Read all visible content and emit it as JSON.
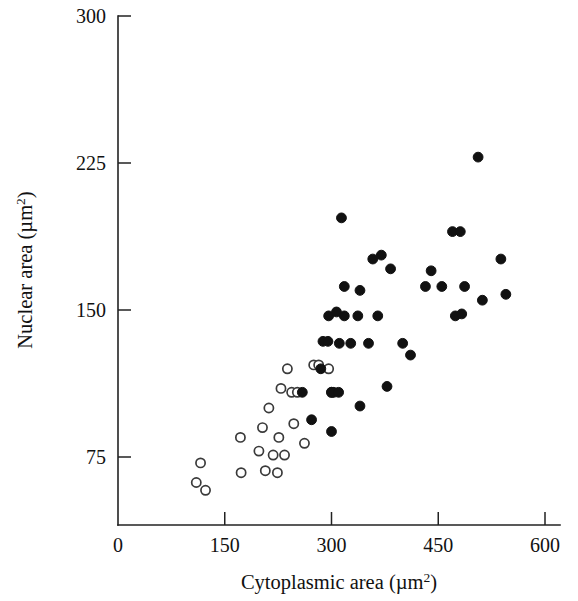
{
  "chart_data": {
    "type": "scatter",
    "title": "",
    "xlabel": "Cytoplasmic area (µm2)",
    "ylabel": "Nuclear area (µm2)",
    "xlabel_base": "Cytoplasmic area (µm",
    "xlabel_sup": "2",
    "xlabel_close": ")",
    "ylabel_base": "Nuclear area (µm",
    "ylabel_sup": "2",
    "ylabel_close": ")",
    "xlim": [
      0,
      600
    ],
    "ylim": [
      55,
      300
    ],
    "xticks": [
      0,
      150,
      300,
      450,
      600
    ],
    "yticks": [
      75,
      150,
      225,
      300
    ],
    "xtick_labels": [
      "0",
      "150",
      "300",
      "450",
      "600"
    ],
    "ytick_labels": [
      "75",
      "150",
      "225",
      "300"
    ],
    "grid": false,
    "legend": "none",
    "marker_colors": {
      "filled": "#111111",
      "open_stroke": "#3a3a3a",
      "open_fill": "#ffffff"
    },
    "series": [
      {
        "name": "open circles",
        "marker": "open-circle",
        "points": [
          [
            110,
            62
          ],
          [
            123,
            58
          ],
          [
            116,
            72
          ],
          [
            172,
            85
          ],
          [
            173,
            67
          ],
          [
            198,
            78
          ],
          [
            203,
            90
          ],
          [
            207,
            68
          ],
          [
            212,
            100
          ],
          [
            218,
            76
          ],
          [
            224,
            67
          ],
          [
            226,
            85
          ],
          [
            229,
            110
          ],
          [
            234,
            76
          ],
          [
            238,
            120
          ],
          [
            244,
            108
          ],
          [
            247,
            92
          ],
          [
            252,
            108
          ],
          [
            262,
            82
          ],
          [
            275,
            122
          ],
          [
            282,
            122
          ],
          [
            296,
            120
          ],
          [
            300,
            108
          ]
        ]
      },
      {
        "name": "filled circles",
        "marker": "filled-circle",
        "points": [
          [
            259,
            108
          ],
          [
            272,
            94
          ],
          [
            285,
            120
          ],
          [
            288,
            134
          ],
          [
            295,
            134
          ],
          [
            296,
            147
          ],
          [
            300,
            108
          ],
          [
            303,
            108
          ],
          [
            307,
            149
          ],
          [
            310,
            108
          ],
          [
            300,
            88
          ],
          [
            311,
            133
          ],
          [
            314,
            197
          ],
          [
            318,
            147
          ],
          [
            318,
            162
          ],
          [
            327,
            133
          ],
          [
            337,
            147
          ],
          [
            340,
            160
          ],
          [
            340,
            101
          ],
          [
            352,
            133
          ],
          [
            358,
            176
          ],
          [
            365,
            147
          ],
          [
            370,
            178
          ],
          [
            378,
            111
          ],
          [
            383,
            171
          ],
          [
            400,
            133
          ],
          [
            411,
            127
          ],
          [
            432,
            162
          ],
          [
            440,
            170
          ],
          [
            455,
            162
          ],
          [
            470,
            190
          ],
          [
            474,
            147
          ],
          [
            481,
            190
          ],
          [
            483,
            148
          ],
          [
            487,
            162
          ],
          [
            506,
            228
          ],
          [
            512,
            155
          ],
          [
            538,
            176
          ],
          [
            545,
            158
          ]
        ]
      }
    ]
  },
  "axes": {
    "x_axis_name": "x-axis",
    "y_axis_name": "y-axis"
  }
}
